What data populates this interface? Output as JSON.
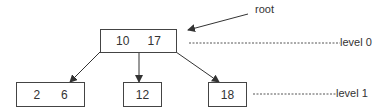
{
  "diagram": {
    "type": "b-tree",
    "root_label": "root",
    "levels": [
      {
        "label": "level 0"
      },
      {
        "label": "level 1"
      }
    ],
    "nodes": {
      "root": {
        "keys": [
          "10",
          "17"
        ]
      },
      "leaf_left": {
        "keys": [
          "2",
          "6"
        ]
      },
      "leaf_middle": {
        "keys": [
          "12"
        ]
      },
      "leaf_right": {
        "keys": [
          "18"
        ]
      }
    },
    "edges": [
      {
        "from": "root",
        "to": "leaf_left"
      },
      {
        "from": "root",
        "to": "leaf_middle"
      },
      {
        "from": "root",
        "to": "leaf_right"
      }
    ]
  }
}
